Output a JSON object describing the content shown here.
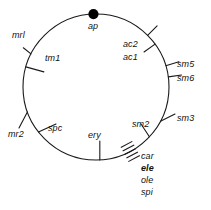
{
  "figure": {
    "type": "circular-genetic-map",
    "background_color": "#ffffff",
    "stroke_color": "#1a1a1a",
    "circle": {
      "cx": 96,
      "cy": 87,
      "r": 73
    },
    "origin_marker": {
      "name": "ap",
      "label": "ap",
      "shape": "filled-circle",
      "radius_px": 5,
      "angle_deg": 268,
      "color": "#000000"
    },
    "loci": [
      {
        "label": "mrl",
        "angle_deg": 207,
        "tick": true,
        "label_x": 12,
        "label_y": 31
      },
      {
        "label": "tm1",
        "angle_deg": 196,
        "tick": true,
        "label_x": 45,
        "label_y": 54
      },
      {
        "label": "ac2",
        "angle_deg": 315,
        "tick": true,
        "label_x": 123,
        "label_y": 40
      },
      {
        "label": "ac1",
        "angle_deg": 324,
        "tick": true,
        "label_x": 123,
        "label_y": 53
      },
      {
        "label": "sm5",
        "angle_deg": 343,
        "tick": true,
        "label_x": 177,
        "label_y": 60
      },
      {
        "label": "sm6",
        "angle_deg": 352,
        "tick": true,
        "label_x": 177,
        "label_y": 74
      },
      {
        "label": "sm3",
        "angle_deg": 28,
        "tick": true,
        "label_x": 177,
        "label_y": 114
      },
      {
        "label": "sm2",
        "angle_deg": 43,
        "tick": true,
        "label_x": 132,
        "label_y": 120
      },
      {
        "label": "mr2",
        "angle_deg": 160,
        "tick": true,
        "label_x": 8,
        "label_y": 130
      },
      {
        "label": "spc",
        "angle_deg": 142,
        "tick": true,
        "label_x": 48,
        "label_y": 124
      },
      {
        "label": "ery",
        "angle_deg": 93,
        "tick": true,
        "label_x": 88,
        "label_y": 138
      }
    ],
    "hatch_cluster": {
      "angle_deg": 62,
      "mark_count": 5,
      "labels": [
        {
          "label": "car",
          "bold": false,
          "x": 141,
          "y": 156
        },
        {
          "label": "ele",
          "bold": true,
          "x": 141,
          "y": 168
        },
        {
          "label": "ole",
          "bold": false,
          "x": 141,
          "y": 180
        },
        {
          "label": "spi",
          "bold": false,
          "x": 141,
          "y": 192
        }
      ]
    }
  }
}
